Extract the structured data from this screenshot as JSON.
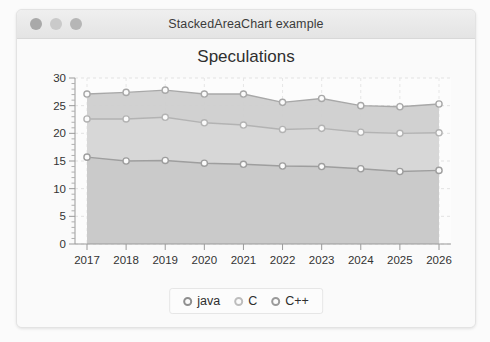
{
  "window": {
    "title": "StackedAreaChart example",
    "controls": [
      {
        "name": "close",
        "color": "#a9a9a9"
      },
      {
        "name": "minimize",
        "color": "#cacaca"
      },
      {
        "name": "zoom",
        "color": "#b6b6b6"
      }
    ]
  },
  "chart_data": {
    "type": "area",
    "stacked": true,
    "title": "Speculations",
    "xlabel": "",
    "ylabel": "",
    "categories": [
      "2017",
      "2018",
      "2019",
      "2020",
      "2021",
      "2022",
      "2023",
      "2024",
      "2025",
      "2026"
    ],
    "xtick_labels": [
      "2017",
      "2018",
      "2019",
      "2020",
      "2021",
      "2022",
      "2023",
      "2024",
      "2025",
      "2026"
    ],
    "ytick_labels": [
      "0",
      "5",
      "10",
      "15",
      "20",
      "25",
      "30"
    ],
    "ylim": [
      0,
      30
    ],
    "ytick_step": 5,
    "minor_ticks": true,
    "grid": true,
    "legend_position": "bottom",
    "series": [
      {
        "name": "java",
        "color": "#9e9e9e",
        "fill": "#c9c9c9",
        "values": [
          15.7,
          15.0,
          15.1,
          14.6,
          14.4,
          14.1,
          14.0,
          13.6,
          13.1,
          13.3
        ],
        "cumulative": [
          15.7,
          15.0,
          15.1,
          14.6,
          14.4,
          14.1,
          14.0,
          13.6,
          13.1,
          13.3
        ]
      },
      {
        "name": "C",
        "color": "#b3b3b3",
        "fill": "#d7d7d7",
        "values": [
          6.9,
          7.6,
          7.8,
          7.3,
          7.1,
          6.6,
          6.9,
          6.6,
          6.9,
          6.8
        ],
        "cumulative": [
          22.6,
          22.6,
          22.9,
          21.9,
          21.5,
          20.7,
          20.9,
          20.2,
          20.0,
          20.1
        ]
      },
      {
        "name": "C++",
        "color": "#a8a8a8",
        "fill": "#cfcfcf",
        "values": [
          4.5,
          4.8,
          4.9,
          5.2,
          5.6,
          4.9,
          5.4,
          4.8,
          4.8,
          5.2
        ],
        "cumulative": [
          27.1,
          27.4,
          27.8,
          27.1,
          27.1,
          25.6,
          26.3,
          25.0,
          24.8,
          25.3
        ]
      }
    ]
  },
  "legend": {
    "items": [
      {
        "label": "java",
        "color": "#8f8f8f"
      },
      {
        "label": "C",
        "color": "#bdbdbd"
      },
      {
        "label": "C++",
        "color": "#9a9a9a"
      }
    ]
  }
}
